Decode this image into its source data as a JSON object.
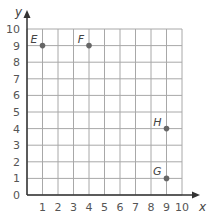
{
  "chart_data": {
    "type": "scatter",
    "title": "",
    "xlabel": "x",
    "ylabel": "y",
    "xlim": [
      0,
      10
    ],
    "ylim": [
      0,
      10
    ],
    "grid": true,
    "x_ticks": [
      "1",
      "2",
      "3",
      "4",
      "5",
      "6",
      "7",
      "8",
      "9",
      "10"
    ],
    "y_ticks": [
      "0",
      "1",
      "2",
      "3",
      "4",
      "5",
      "6",
      "7",
      "8",
      "9",
      "10"
    ],
    "points": [
      {
        "label": "E",
        "x": 1,
        "y": 9
      },
      {
        "label": "F",
        "x": 4,
        "y": 9
      },
      {
        "label": "H",
        "x": 9,
        "y": 4
      },
      {
        "label": "G",
        "x": 9,
        "y": 1
      }
    ]
  },
  "colors": {
    "grid": "#a8a8a8",
    "axis": "#333333",
    "point": "#666666"
  }
}
